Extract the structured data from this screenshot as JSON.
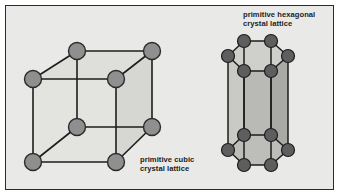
{
  "figure": {
    "background_color": "#ffffff",
    "panel_color": "#e9e9e7",
    "panel_border_color": "#2b2b2b"
  },
  "captions": {
    "cubic": {
      "line1": "primitive cubic",
      "line2": "crystal lattice",
      "full": "primitive cubic\ncrystal lattice"
    },
    "hexagonal": {
      "line1": "primitive hexagonal",
      "line2": "crystal lattice",
      "full": "primitive hexagonal\ncrystal lattice"
    }
  },
  "cubic_lattice": {
    "name": "primitive cubic crystal lattice",
    "atom_count": 8,
    "atom_fill": "#8f8f8f",
    "atom_stroke": "#2b2b2b",
    "atom_radius": 8.5,
    "edge_color": "#1d1d1d",
    "face_shade": "#dcdcd9",
    "atoms": [
      {
        "id": "back-top-left",
        "x": 77,
        "y": 51
      },
      {
        "id": "back-top-right",
        "x": 152,
        "y": 51
      },
      {
        "id": "front-top-left",
        "x": 33,
        "y": 79
      },
      {
        "id": "front-top-right",
        "x": 116,
        "y": 79
      },
      {
        "id": "back-bottom-left",
        "x": 77,
        "y": 127
      },
      {
        "id": "back-bottom-right",
        "x": 152,
        "y": 127
      },
      {
        "id": "front-bottom-left",
        "x": 33,
        "y": 162
      },
      {
        "id": "front-bottom-right",
        "x": 116,
        "y": 162
      }
    ]
  },
  "hexagonal_lattice": {
    "name": "primitive hexagonal crystal lattice",
    "atom_count": 12,
    "atom_fill": "#5e5e5e",
    "atom_stroke": "#1d1d1d",
    "atom_radius": 6.5,
    "edge_color": "#1d1d1d",
    "face_shade": "#b9b9b6",
    "top_atoms": [
      {
        "id": "top-back-left",
        "x": 244,
        "y": 41
      },
      {
        "id": "top-back-right",
        "x": 271,
        "y": 41
      },
      {
        "id": "top-left",
        "x": 228,
        "y": 56
      },
      {
        "id": "top-right",
        "x": 288,
        "y": 56
      },
      {
        "id": "top-front-left",
        "x": 244,
        "y": 71
      },
      {
        "id": "top-front-right",
        "x": 271,
        "y": 71
      }
    ],
    "bottom_atoms": [
      {
        "id": "bot-back-left",
        "x": 244,
        "y": 135
      },
      {
        "id": "bot-back-right",
        "x": 271,
        "y": 135
      },
      {
        "id": "bot-left",
        "x": 228,
        "y": 150
      },
      {
        "id": "bot-right",
        "x": 288,
        "y": 150
      },
      {
        "id": "bot-front-left",
        "x": 244,
        "y": 165
      },
      {
        "id": "bot-front-right",
        "x": 271,
        "y": 165
      }
    ]
  }
}
